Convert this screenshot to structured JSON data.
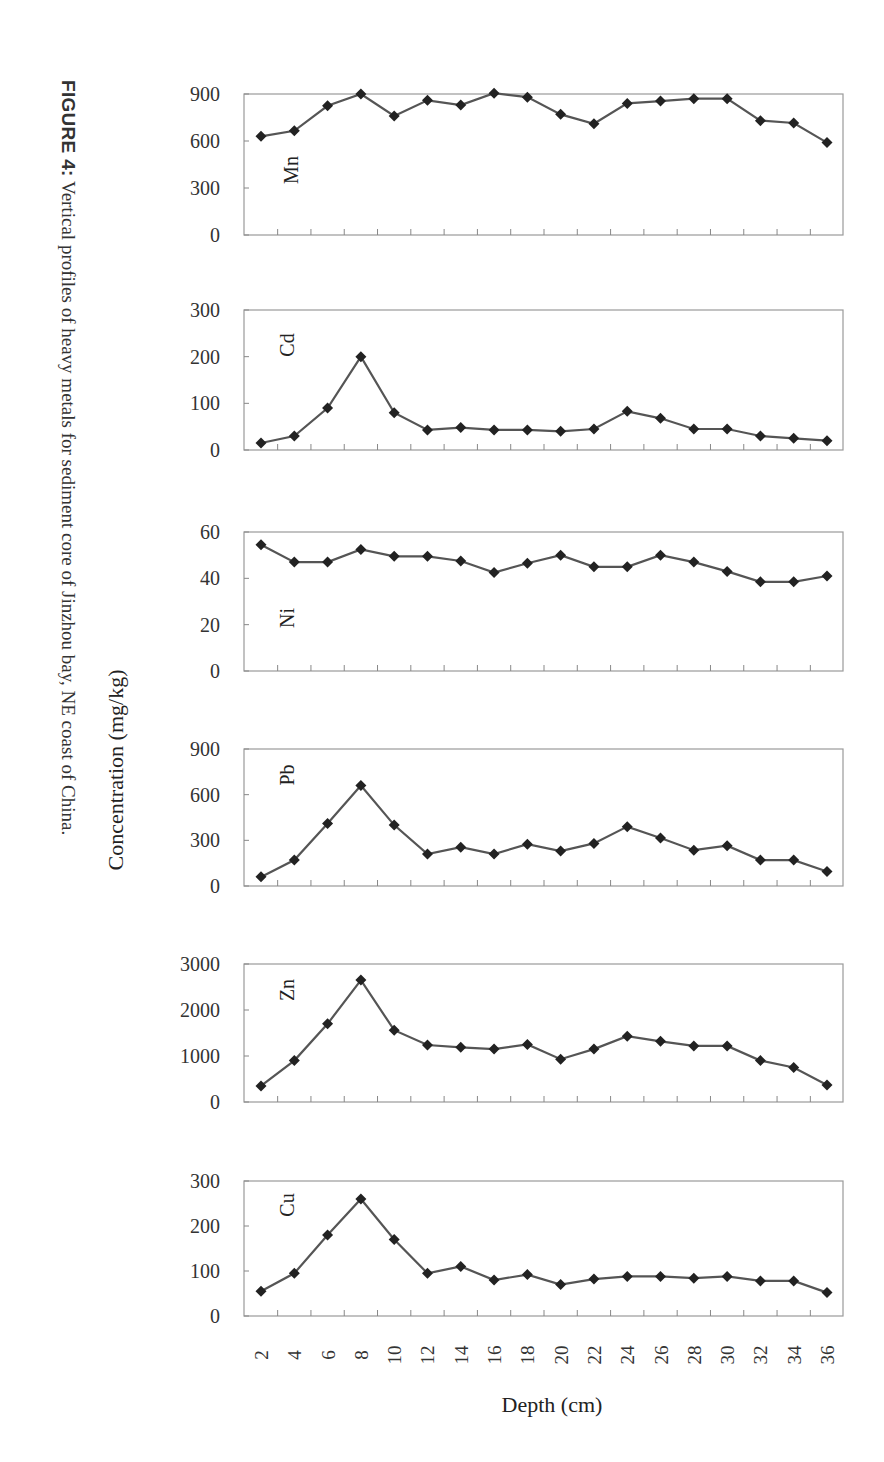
{
  "figure": {
    "caption_label": "FIGURE 4:",
    "caption_text": " Vertical profiles of heavy metals for sediment core of Jinzhou bay, NE coast of China."
  },
  "chart_data": {
    "type": "line",
    "title": "Vertical profiles of heavy metals for sediment core of Jinzhou bay, NE coast of China",
    "xlabel": "Depth (cm)",
    "ylabel": "Concentration (mg/kg)",
    "x": [
      2,
      4,
      6,
      8,
      10,
      12,
      14,
      16,
      18,
      20,
      22,
      24,
      26,
      28,
      30,
      32,
      34,
      36
    ],
    "grid": false,
    "marker": "diamond",
    "line_color": "#555555",
    "marker_color": "#222222",
    "panels": [
      {
        "name": "Mn",
        "ylim": [
          0,
          900
        ],
        "yticks": [
          0,
          300,
          600,
          900
        ],
        "values": [
          630,
          665,
          825,
          900,
          760,
          860,
          830,
          905,
          880,
          770,
          710,
          840,
          855,
          870,
          870,
          730,
          715,
          590
        ]
      },
      {
        "name": "Cd",
        "ylim": [
          0,
          300
        ],
        "yticks": [
          0,
          100,
          200,
          300
        ],
        "values": [
          15,
          30,
          90,
          200,
          80,
          43,
          48,
          43,
          43,
          40,
          45,
          83,
          68,
          45,
          45,
          30,
          25,
          20
        ]
      },
      {
        "name": "Ni",
        "ylim": [
          0,
          60
        ],
        "yticks": [
          0,
          20,
          40,
          60
        ],
        "values": [
          54.5,
          47,
          47,
          52.5,
          49.5,
          49.5,
          47.5,
          42.5,
          46.5,
          50,
          45,
          45,
          50,
          47,
          43,
          38.5,
          38.5,
          41
        ]
      },
      {
        "name": "Pb",
        "ylim": [
          0,
          900
        ],
        "yticks": [
          0,
          300,
          600,
          900
        ],
        "values": [
          60,
          170,
          410,
          660,
          400,
          210,
          255,
          210,
          275,
          230,
          280,
          390,
          315,
          235,
          265,
          170,
          170,
          95
        ]
      },
      {
        "name": "Zn",
        "ylim": [
          0,
          3000
        ],
        "yticks": [
          0,
          1000,
          2000,
          3000
        ],
        "values": [
          350,
          900,
          1700,
          2650,
          1560,
          1240,
          1190,
          1150,
          1250,
          930,
          1150,
          1430,
          1320,
          1220,
          1220,
          900,
          750,
          370
        ]
      },
      {
        "name": "Cu",
        "ylim": [
          0,
          300
        ],
        "yticks": [
          0,
          100,
          200,
          300
        ],
        "values": [
          55,
          95,
          180,
          260,
          170,
          95,
          110,
          80,
          92,
          70,
          82,
          88,
          88,
          84,
          88,
          78,
          78,
          52
        ]
      }
    ]
  }
}
